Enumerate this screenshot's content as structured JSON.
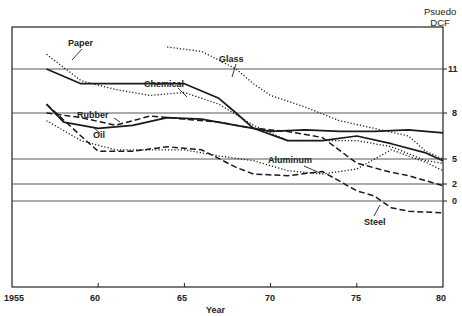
{
  "chart_data": {
    "type": "line",
    "title": "",
    "xlabel": "Year",
    "ylabel": "Psuedo DCF",
    "x_ticks": [
      "1955",
      "60",
      "65",
      "70",
      "75",
      "80"
    ],
    "y_ticks": [
      "11",
      "8",
      "5",
      "2",
      "0"
    ],
    "xlim": [
      1955,
      1980
    ],
    "grid": "horizontal lines at y ticks",
    "legend": "inline labels",
    "series": [
      {
        "name": "Paper",
        "style": "dotted",
        "x": [
          1957,
          1959,
          1961,
          1963,
          1965,
          1967,
          1969,
          1971,
          1973,
          1975,
          1977,
          1979,
          1980
        ],
        "y": [
          12,
          10.2,
          9.6,
          9.2,
          9.4,
          8.6,
          7.2,
          6.2,
          6.2,
          6.2,
          5.8,
          4.8,
          4.5
        ]
      },
      {
        "name": "Chemical",
        "style": "solid",
        "x": [
          1957,
          1959,
          1961,
          1963,
          1965,
          1967,
          1968,
          1969,
          1971,
          1973,
          1975,
          1977,
          1979,
          1980
        ],
        "y": [
          11,
          10,
          10,
          10,
          10,
          9,
          8,
          7,
          6.2,
          6.2,
          6.5,
          6,
          5.4,
          4.8
        ]
      },
      {
        "name": "Glass",
        "style": "dotted",
        "x": [
          1964,
          1966,
          1968,
          1969,
          1970,
          1972,
          1974,
          1976,
          1978,
          1979,
          1980
        ],
        "y": [
          12.5,
          12.2,
          11,
          10,
          9.2,
          8.4,
          7.5,
          7,
          6.5,
          5.5,
          5
        ]
      },
      {
        "name": "Rubber",
        "style": "dashed",
        "x": [
          1957,
          1959,
          1961,
          1963,
          1965,
          1967,
          1969,
          1971,
          1973,
          1975,
          1977,
          1978,
          1980
        ],
        "y": [
          8,
          7.7,
          7.2,
          7.8,
          7.6,
          7.4,
          7,
          6.8,
          6.4,
          4.5,
          3.4,
          3,
          1.8
        ]
      },
      {
        "name": "Oil",
        "style": "solid",
        "x": [
          1957,
          1958,
          1960,
          1962,
          1964,
          1966,
          1968,
          1970,
          1972,
          1974,
          1976,
          1978,
          1980
        ],
        "y": [
          8.6,
          7.4,
          7,
          7.2,
          7.7,
          7.6,
          7.2,
          6.8,
          6.9,
          6.8,
          6.8,
          6.9,
          6.7
        ]
      },
      {
        "name": "Aluminum",
        "style": "dotted",
        "x": [
          1957,
          1959,
          1961,
          1963,
          1965,
          1967,
          1969,
          1971,
          1973,
          1975,
          1977,
          1979,
          1980
        ],
        "y": [
          7.5,
          6.2,
          5.6,
          5.6,
          5.6,
          5.2,
          4.8,
          3.6,
          3.2,
          3.8,
          5.6,
          4.6,
          3.6
        ]
      },
      {
        "name": "Steel",
        "style": "dashed",
        "x": [
          1957,
          1959,
          1960,
          1962,
          1964,
          1966,
          1968,
          1969,
          1971,
          1973,
          1975,
          1976,
          1977,
          1978,
          1980
        ],
        "y": [
          8.6,
          6.5,
          5.5,
          5.5,
          5.8,
          5.6,
          4,
          3.2,
          3,
          3.5,
          1.2,
          0.6,
          -0.8,
          -1.2,
          -1.4
        ]
      }
    ]
  },
  "labels": {
    "ylabel_line1": "Psuedo",
    "ylabel_line2": "DCF",
    "xlabel": "Year",
    "paper": "Paper",
    "chemical": "Chemical",
    "glass": "Glass",
    "rubber": "Rubber",
    "oil": "Oil",
    "aluminum": "Aluminum",
    "steel": "Steel",
    "x_ticks": [
      "1955",
      "60",
      "65",
      "70",
      "75",
      "80"
    ],
    "y_ticks": [
      "11",
      "8",
      "5",
      "2",
      "0"
    ]
  }
}
